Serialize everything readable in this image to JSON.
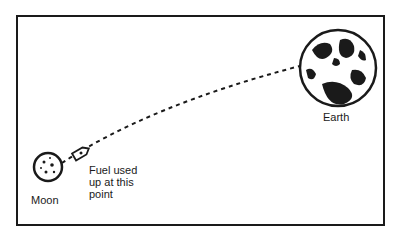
{
  "diagram": {
    "labels": {
      "earth": "Earth",
      "moon": "Moon",
      "fuel_note": "Fuel used up at this point"
    },
    "colors": {
      "ink": "#1a1a1a",
      "background": "#ffffff"
    }
  }
}
